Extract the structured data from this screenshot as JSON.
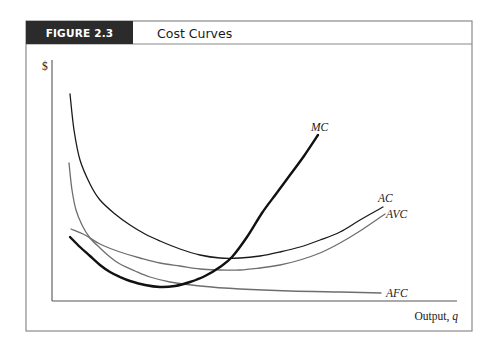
{
  "figure": {
    "label": "FIGURE 2.3",
    "title": "Cost Curves",
    "header_bg": "#2b2b2b",
    "frame_color": "#8a8a8a"
  },
  "chart_data": {
    "type": "line",
    "title": "Cost Curves",
    "xlabel": "Output, q",
    "xlabel_parts": {
      "text": "Output, ",
      "var": "q"
    },
    "ylabel": "$",
    "grid": false,
    "legend": "inline labels at curve ends",
    "axis_ranges": {
      "x": [
        0,
        1
      ],
      "y": [
        0,
        1
      ]
    },
    "series": [
      {
        "name": "AC",
        "label": "AC",
        "color": "#1a1a1a",
        "width": 1.3,
        "points": [
          [
            70,
            94
          ],
          [
            74,
            130
          ],
          [
            80,
            160
          ],
          [
            90,
            184
          ],
          [
            100,
            200
          ],
          [
            115,
            214
          ],
          [
            130,
            225
          ],
          [
            145,
            234
          ],
          [
            160,
            241
          ],
          [
            180,
            249
          ],
          [
            200,
            255
          ],
          [
            220,
            258
          ],
          [
            240,
            258
          ],
          [
            260,
            256
          ],
          [
            280,
            252
          ],
          [
            300,
            247
          ],
          [
            320,
            240
          ],
          [
            340,
            232
          ],
          [
            360,
            220
          ],
          [
            383,
            207
          ]
        ],
        "label_pos": [
          378,
          202
        ]
      },
      {
        "name": "AVC",
        "label": "AVC",
        "color": "#6e6e6e",
        "width": 1.3,
        "points": [
          [
            71,
            229
          ],
          [
            85,
            235
          ],
          [
            100,
            244
          ],
          [
            120,
            252
          ],
          [
            140,
            258
          ],
          [
            160,
            263
          ],
          [
            180,
            266
          ],
          [
            200,
            269
          ],
          [
            220,
            270
          ],
          [
            240,
            270
          ],
          [
            260,
            268
          ],
          [
            280,
            265
          ],
          [
            300,
            260
          ],
          [
            320,
            253
          ],
          [
            340,
            243
          ],
          [
            360,
            231
          ],
          [
            385,
            214
          ]
        ],
        "label_pos": [
          386,
          218
        ]
      },
      {
        "name": "AFC",
        "label": "AFC",
        "color": "#6e6e6e",
        "width": 1.3,
        "points": [
          [
            69,
            163
          ],
          [
            72,
            190
          ],
          [
            76,
            210
          ],
          [
            82,
            225
          ],
          [
            90,
            238
          ],
          [
            100,
            248
          ],
          [
            110,
            257
          ],
          [
            120,
            264
          ],
          [
            135,
            271
          ],
          [
            150,
            277
          ],
          [
            170,
            282
          ],
          [
            200,
            286
          ],
          [
            240,
            289
          ],
          [
            290,
            291
          ],
          [
            340,
            292
          ],
          [
            381,
            293
          ]
        ],
        "label_pos": [
          386,
          297
        ]
      },
      {
        "name": "MC",
        "label": "MC",
        "color": "#111111",
        "width": 2.4,
        "points": [
          [
            70,
            237
          ],
          [
            80,
            247
          ],
          [
            90,
            256
          ],
          [
            100,
            265
          ],
          [
            110,
            272
          ],
          [
            120,
            277
          ],
          [
            130,
            281
          ],
          [
            145,
            285
          ],
          [
            160,
            287
          ],
          [
            175,
            286
          ],
          [
            190,
            282
          ],
          [
            205,
            276
          ],
          [
            220,
            267
          ],
          [
            232,
            257
          ],
          [
            247,
            237
          ],
          [
            262,
            213
          ],
          [
            276,
            194
          ],
          [
            290,
            175
          ],
          [
            304,
            156
          ],
          [
            318,
            135
          ]
        ],
        "label_pos": [
          311,
          131
        ]
      }
    ],
    "intersections": [
      {
        "curves": [
          "MC",
          "AVC"
        ],
        "note": "MC crosses AVC at AVC minimum"
      },
      {
        "curves": [
          "MC",
          "AC"
        ],
        "note": "MC crosses AC at AC minimum"
      }
    ]
  },
  "layout": {
    "frame": {
      "x": 26,
      "y": 21,
      "w": 446,
      "h": 310
    },
    "header_h": 23,
    "label_box_w": 107,
    "y_axis": {
      "x": 52,
      "top": 60,
      "bottom": 301
    },
    "x_axis": {
      "y": 301,
      "left": 52,
      "right": 457
    }
  }
}
